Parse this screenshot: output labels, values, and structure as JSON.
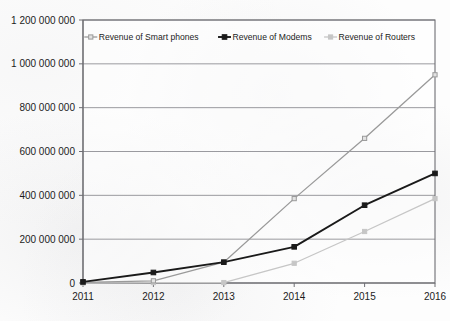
{
  "chart_data": {
    "type": "line",
    "title": "",
    "subtitle": "",
    "xlabel": "",
    "ylabel": "",
    "categories": [
      "2011",
      "2012",
      "2013",
      "2014",
      "2015",
      "2016"
    ],
    "x": [
      2011,
      2012,
      2013,
      2014,
      2015,
      2016
    ],
    "ylim": [
      0,
      1200000000
    ],
    "ytick_values": [
      0,
      200000000,
      400000000,
      600000000,
      800000000,
      1000000000,
      1200000000
    ],
    "ytick_labels": [
      "0",
      "200 000 000",
      "400 000 000",
      "600 000 000",
      "800 000 000",
      "1 000 000 000",
      "1 200 000 000"
    ],
    "grid": true,
    "grid_axis": "y",
    "legend_position": "top-center",
    "series": [
      {
        "name": "Revenue of Smart phones",
        "color": "#9a9a9a",
        "marker": "square",
        "values": [
          3000000,
          10000000,
          95000000,
          385000000,
          660000000,
          950000000
        ]
      },
      {
        "name": "Revenue of Modems",
        "color": "#1a1a1a",
        "marker": "square",
        "values": [
          5000000,
          48000000,
          95000000,
          165000000,
          355000000,
          500000000
        ]
      },
      {
        "name": "Revenue of Routers",
        "color": "#c6c6c6",
        "marker": "square",
        "values": [
          0,
          2000000,
          2000000,
          90000000,
          235000000,
          385000000
        ]
      }
    ]
  },
  "legend": {
    "items": [
      {
        "label": "Revenue of Smart phones",
        "color": "#9a9a9a"
      },
      {
        "label": "Revenue of Modems",
        "color": "#1a1a1a"
      },
      {
        "label": "Revenue of Routers",
        "color": "#c6c6c6"
      }
    ]
  }
}
